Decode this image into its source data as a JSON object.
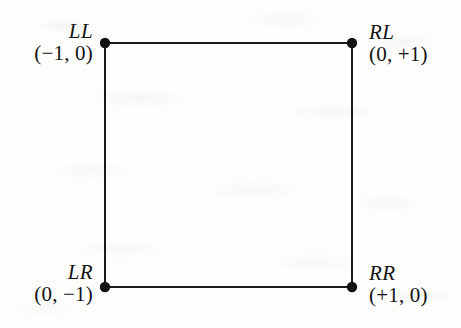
{
  "figure": {
    "type": "vertex-labeled-square-diagram",
    "background_color": "#fdfdfc",
    "stroke_color": "#1a1a1a",
    "text_color": "#141414",
    "square": {
      "left": 105,
      "top": 43,
      "right": 352,
      "bottom": 287,
      "stroke_width": 2,
      "vertex_dot_radius": 5.2
    },
    "vertices": [
      {
        "id": "LL",
        "name": "LL",
        "coord": "(−1, 0)",
        "coord_plain": "(-1,0)",
        "x": -1,
        "y": 0,
        "position": "top-left",
        "label_side": "left",
        "cx": 105,
        "cy": 43
      },
      {
        "id": "RL",
        "name": "RL",
        "coord": "(0, +1)",
        "coord_plain": "(0,+1)",
        "x": 0,
        "y": 1,
        "position": "top-right",
        "label_side": "right",
        "cx": 352,
        "cy": 43
      },
      {
        "id": "LR",
        "name": "LR",
        "coord": "(0, −1)",
        "coord_plain": "(0,-1)",
        "x": 0,
        "y": -1,
        "position": "bottom-left",
        "label_side": "left",
        "cx": 105,
        "cy": 287
      },
      {
        "id": "RR",
        "name": "RR",
        "coord": "(+1, 0)",
        "coord_plain": "(+1,0)",
        "x": 1,
        "y": 0,
        "position": "bottom-right",
        "label_side": "right",
        "cx": 352,
        "cy": 287
      }
    ],
    "edges": [
      {
        "from": "LL",
        "to": "RL",
        "orientation": "horizontal",
        "side": "top"
      },
      {
        "from": "RL",
        "to": "RR",
        "orientation": "vertical",
        "side": "right"
      },
      {
        "from": "RR",
        "to": "LR",
        "orientation": "horizontal",
        "side": "bottom"
      },
      {
        "from": "LR",
        "to": "LL",
        "orientation": "vertical",
        "side": "left"
      }
    ]
  }
}
